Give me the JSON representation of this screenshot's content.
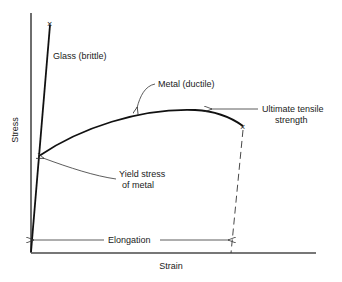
{
  "diagram": {
    "type": "stress-strain curve",
    "axes": {
      "y_label": "Stress",
      "x_label": "Strain"
    },
    "curves": [
      {
        "name": "glass",
        "label": "Glass (brittle)",
        "end_marker": "x"
      },
      {
        "name": "metal",
        "label": "Metal (ductile)",
        "end_marker": "x"
      }
    ],
    "annotations": {
      "yield_line1": "Yield stress",
      "yield_line2": "of metal",
      "uts_line1": "Ultimate tensile",
      "uts_line2": "strength",
      "elongation": "Elongation"
    },
    "markers": {
      "fracture": "×"
    }
  }
}
